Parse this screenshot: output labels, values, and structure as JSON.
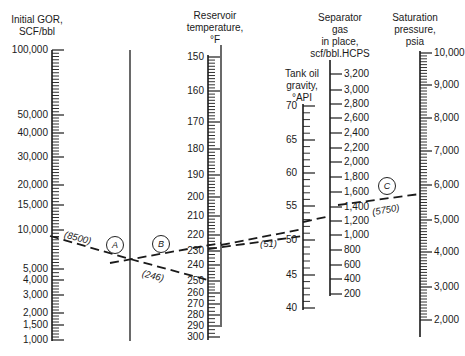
{
  "chart_data": {
    "type": "nomograph",
    "title": "",
    "axes": [
      {
        "id": "initial_gor",
        "title": "Initial GOR,\nSCF/bbl",
        "scale": "log",
        "ticks": [
          "100,000",
          "50,000",
          "40,000",
          "30,000",
          "20,000",
          "15,000",
          "10,000",
          "5,000",
          "4,000",
          "3,000",
          "2,000",
          "1,500",
          "1,000"
        ],
        "range": [
          1000,
          100000
        ]
      },
      {
        "id": "pivot_a",
        "title": "",
        "type": "turning-line",
        "label": "A"
      },
      {
        "id": "reservoir_temperature",
        "title": "Reservoir\ntemperature,\n°F",
        "scale": "nonlinear",
        "ticks": [
          "150",
          "160",
          "170",
          "180",
          "190",
          "200",
          "210",
          "220",
          "230",
          "240",
          "250",
          "260",
          "270",
          "280",
          "290",
          "300"
        ],
        "range": [
          150,
          300
        ]
      },
      {
        "id": "pivot_b",
        "title": "",
        "type": "turning-line",
        "label": "B"
      },
      {
        "id": "tank_oil_gravity",
        "title": "Tank oil\ngravity,\n°API",
        "scale": "linear",
        "ticks": [
          "70",
          "65",
          "60",
          "55",
          "50",
          "45",
          "40"
        ],
        "range": [
          40,
          70
        ]
      },
      {
        "id": "separator_gas_in_place",
        "title": "Separator\ngas\nin place,\nscf/bbl.HCPS",
        "scale": "linear",
        "ticks": [
          "3,200",
          "3,000",
          "2,800",
          "2,600",
          "2,400",
          "2,200",
          "2,000",
          "1,800",
          "1,600",
          "1,400",
          "1,200",
          "1,000",
          "800",
          "600",
          "400",
          "200"
        ],
        "range": [
          200,
          3200
        ]
      },
      {
        "id": "saturation_pressure",
        "title": "Saturation\npressure,\npsia",
        "scale": "nonlinear",
        "ticks": [
          "10,000",
          "9,000",
          "8,000",
          "7,000",
          "6,000",
          "5,000",
          "4,000",
          "3,000",
          "2,000"
        ],
        "range": [
          1500,
          10000
        ]
      }
    ],
    "example": {
      "initial_gor": 8500,
      "reservoir_temperature": 246,
      "tank_oil_gravity": 51,
      "saturation_pressure": 5750,
      "annotations": [
        "(8500)",
        "(246)",
        "(51)",
        "(5750)"
      ],
      "steps": [
        "A",
        "B",
        "C"
      ]
    }
  },
  "labels": {
    "gor_title": "Initial GOR,\nSCF/bbl",
    "temp_title": "Reservoir\ntemperature,\n°F",
    "api_title": "Tank oil\ngravity,\n°API",
    "sep_title": "Separator\ngas\nin place,\nscf/bbl.HCPS",
    "psat_title": "Saturation\npressure,\npsia",
    "ann_gor": "(8500)",
    "ann_temp": "(246)",
    "ann_api": "(51)",
    "ann_psat": "(5750)",
    "circle_a": "A",
    "circle_b": "B",
    "circle_c": "C"
  },
  "ticks": {
    "gor": [
      {
        "t": "100,000",
        "y": 50
      },
      {
        "t": "50,000",
        "y": 115
      },
      {
        "t": "40,000",
        "y": 133
      },
      {
        "t": "30,000",
        "y": 157
      },
      {
        "t": "20,000",
        "y": 185
      },
      {
        "t": "15,000",
        "y": 205
      },
      {
        "t": "10,000",
        "y": 230
      },
      {
        "t": "5,000",
        "y": 269
      },
      {
        "t": "4,000",
        "y": 280
      },
      {
        "t": "3,000",
        "y": 295
      },
      {
        "t": "2,000",
        "y": 313
      },
      {
        "t": "1,500",
        "y": 325
      },
      {
        "t": "1,000",
        "y": 340
      }
    ],
    "temp": [
      {
        "t": "150",
        "y": 57
      },
      {
        "t": "160",
        "y": 91
      },
      {
        "t": "170",
        "y": 122
      },
      {
        "t": "180",
        "y": 149
      },
      {
        "t": "190",
        "y": 175
      },
      {
        "t": "200",
        "y": 197
      },
      {
        "t": "210",
        "y": 216
      },
      {
        "t": "220",
        "y": 235
      },
      {
        "t": "230",
        "y": 251
      },
      {
        "t": "240",
        "y": 265
      },
      {
        "t": "250",
        "y": 281
      },
      {
        "t": "260",
        "y": 293
      },
      {
        "t": "270",
        "y": 304
      },
      {
        "t": "280",
        "y": 315
      },
      {
        "t": "290",
        "y": 326
      },
      {
        "t": "300",
        "y": 337
      }
    ],
    "api": [
      {
        "t": "70",
        "y": 106
      },
      {
        "t": "65",
        "y": 140
      },
      {
        "t": "60",
        "y": 173
      },
      {
        "t": "55",
        "y": 206
      },
      {
        "t": "50",
        "y": 240
      },
      {
        "t": "45",
        "y": 275
      },
      {
        "t": "40",
        "y": 308
      }
    ],
    "sep": [
      {
        "t": "3,200",
        "y": 74
      },
      {
        "t": "3,000",
        "y": 90
      },
      {
        "t": "2,800",
        "y": 104
      },
      {
        "t": "2,600",
        "y": 118
      },
      {
        "t": "2,400",
        "y": 133
      },
      {
        "t": "2,200",
        "y": 148
      },
      {
        "t": "2,000",
        "y": 162
      },
      {
        "t": "1,800",
        "y": 177
      },
      {
        "t": "1,600",
        "y": 192
      },
      {
        "t": "1,400",
        "y": 207
      },
      {
        "t": "1,200",
        "y": 221
      },
      {
        "t": "1,000",
        "y": 235
      },
      {
        "t": "800",
        "y": 250
      },
      {
        "t": "600",
        "y": 265
      },
      {
        "t": "400",
        "y": 279
      },
      {
        "t": "200",
        "y": 294
      }
    ],
    "psat": [
      {
        "t": "10,000",
        "y": 53
      },
      {
        "t": "9,000",
        "y": 85
      },
      {
        "t": "8,000",
        "y": 118
      },
      {
        "t": "7,000",
        "y": 151
      },
      {
        "t": "6,000",
        "y": 185
      },
      {
        "t": "5,000",
        "y": 220
      },
      {
        "t": "4,000",
        "y": 252
      },
      {
        "t": "3,000",
        "y": 287
      },
      {
        "t": "2,000",
        "y": 320
      }
    ]
  }
}
